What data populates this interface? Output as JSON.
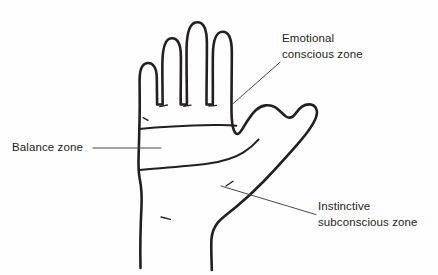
{
  "figure": {
    "background_color": "#fefefe",
    "ink_color": "#231f20",
    "text_color": "#231f20"
  },
  "labels": {
    "emotional": {
      "line1": "Emotional",
      "line2": "conscious zone"
    },
    "balance": {
      "line1": "Balance zone"
    },
    "instinctive": {
      "line1": "Instinctive",
      "line2": "subconscious zone"
    }
  },
  "annotations": {
    "leader_emotional": "leader-line-emotional",
    "leader_balance": "leader-line-balance",
    "leader_instinctive": "leader-line-instinctive"
  },
  "drawing_parts": {
    "hand_outline": "hand-outline-path",
    "balance_band_top": "balance-band-top-line",
    "balance_band_bottom": "balance-band-bottom-line",
    "knuckle_creases": "knuckle-crease-marks",
    "wrist_crease": "wrist-crease-mark"
  }
}
